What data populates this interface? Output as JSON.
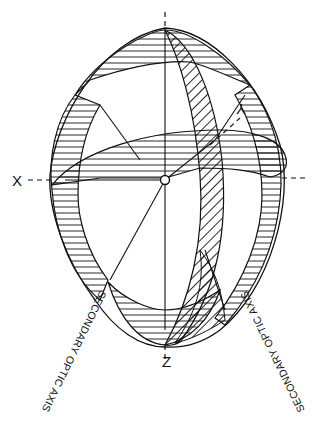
{
  "figure": {
    "type": "optical indicatrix diagram",
    "stroke_color": "#111111",
    "background": "#ffffff"
  },
  "axes": {
    "x_label": "X",
    "y_label": "Y",
    "z_label": "Z"
  },
  "annotations": {
    "left_axis_label": "SECONDARY OPTIC AXIS",
    "right_axis_label": "SECONDARY OPTIC AXIS"
  }
}
